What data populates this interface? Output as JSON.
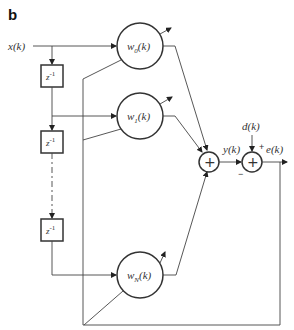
{
  "figure": {
    "panel_label": "b",
    "type": "adaptive FIR filter (tapped delay line) block diagram"
  },
  "signals": {
    "input": "x(k)",
    "output": "y(k)",
    "desired": "d(k)",
    "error": "e(k)"
  },
  "delay_blocks": [
    {
      "label": "z",
      "exponent": "-1"
    },
    {
      "label": "z",
      "exponent": "-1"
    },
    {
      "label": "z",
      "exponent": "-1"
    }
  ],
  "weights": [
    {
      "label": "w",
      "subscript": "0",
      "arg": "(k)"
    },
    {
      "label": "w",
      "subscript": "1",
      "arg": "(k)"
    },
    {
      "label": "w",
      "subscript": "N",
      "arg": "(k)"
    }
  ],
  "summers": [
    {
      "name": "output-sum",
      "glyph": "+"
    },
    {
      "name": "error-sum",
      "glyph": "+",
      "plus_sign": "+",
      "minus_sign": "−"
    }
  ]
}
